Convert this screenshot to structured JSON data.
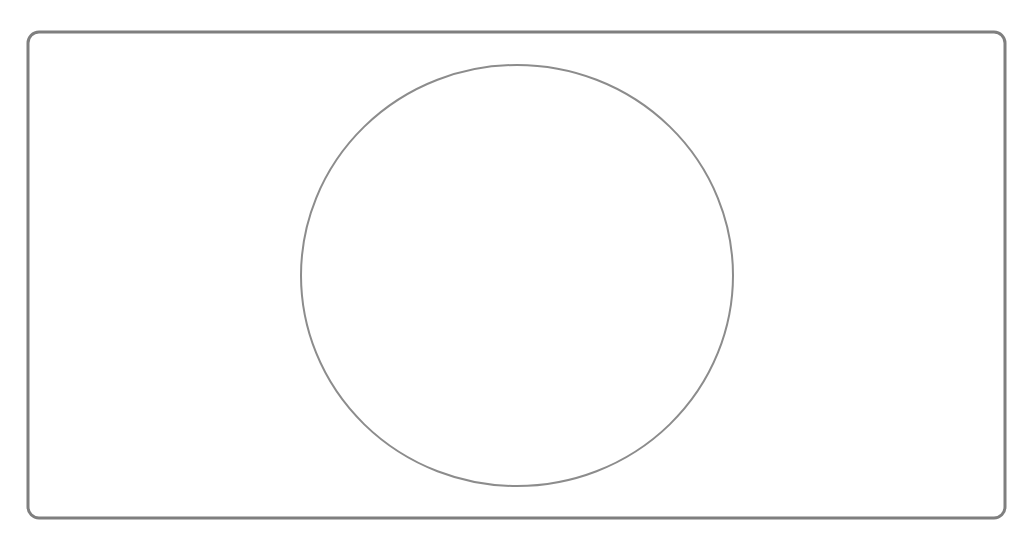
{
  "diagram": {
    "background": "#ffffff",
    "frame": {
      "shape": "rounded-rectangle",
      "x": 28,
      "y": 32,
      "width": 977,
      "height": 486,
      "radius": 11,
      "stroke": "#7f7f7f",
      "stroke_width": 3
    },
    "circle": {
      "shape": "ellipse",
      "cx": 517,
      "cy": 275.5,
      "rx": 216,
      "ry": 210.5,
      "stroke": "#8c8c8c",
      "stroke_width": 2
    }
  }
}
